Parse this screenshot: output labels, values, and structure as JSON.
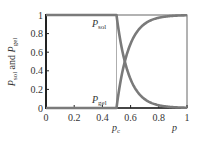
{
  "chart_data": {
    "type": "line",
    "title": "",
    "xlabel": "p",
    "ylabel": "P_sol and P_gel",
    "xlim": [
      0,
      1
    ],
    "ylim": [
      0,
      1
    ],
    "grid": false,
    "legend": "none (inline curve labels)",
    "x_ticks": [
      "0",
      "0.2",
      "0.4",
      "0.6",
      "0.8",
      "1"
    ],
    "y_ticks": [
      "0",
      "0.2",
      "0.4",
      "0.6",
      "0.8",
      "1"
    ],
    "annotations": [
      {
        "text": "p_c",
        "x": 0.5,
        "note": "critical threshold, thin vertical line"
      },
      {
        "text": "P_sol",
        "x": 0.42,
        "y": 0.88
      },
      {
        "text": "P_gel",
        "x": 0.42,
        "y": 0.1
      }
    ],
    "x": [
      0,
      0.1,
      0.2,
      0.3,
      0.4,
      0.5,
      0.52,
      0.55,
      0.6,
      0.65,
      0.7,
      0.75,
      0.8,
      0.85,
      0.9,
      0.95,
      1.0
    ],
    "series": [
      {
        "name": "P_sol",
        "values": [
          1,
          1,
          1,
          1,
          1,
          1,
          0.8,
          0.58,
          0.35,
          0.2,
          0.11,
          0.05,
          0.02,
          0.01,
          0.0,
          0.0,
          0.0
        ]
      },
      {
        "name": "P_gel",
        "values": [
          0,
          0,
          0,
          0,
          0,
          0,
          0.2,
          0.42,
          0.65,
          0.8,
          0.89,
          0.95,
          0.98,
          0.99,
          1.0,
          1.0,
          1.0
        ]
      }
    ]
  },
  "labels": {
    "y_axis_main_1": "P",
    "y_axis_sub_1": "sol",
    "y_axis_and": " and ",
    "y_axis_main_2": "P",
    "y_axis_sub_2": "gel",
    "x_axis": "p",
    "pc_main": "p",
    "pc_sub": "c",
    "psol_main": "P",
    "psol_sub": "sol",
    "pgel_main": "P",
    "pgel_sub": "gel"
  },
  "colors": {
    "curve": "#7a7a7a",
    "axis": "#222222",
    "frame": "#555555"
  }
}
